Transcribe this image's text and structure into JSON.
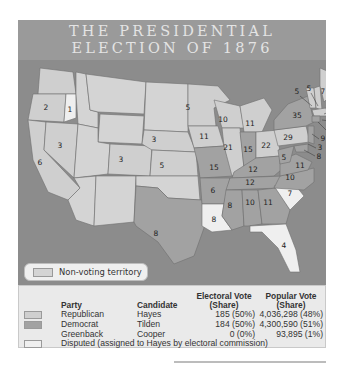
{
  "title": {
    "line1": "THE PRESIDENTIAL",
    "line2": "ELECTION OF 1876"
  },
  "map": {
    "colors": {
      "republican": "#cfcfcf",
      "democrat": "#a2a2a2",
      "disputed": "#efefef",
      "non_voting": "#d4d4d4",
      "water": "#8c8c8c"
    },
    "states": [
      {
        "name": "Oregon",
        "party": "Republican",
        "electoral_votes": "2"
      },
      {
        "name": "Oregon (disputed elector)",
        "party": "Disputed",
        "electoral_votes": "1"
      },
      {
        "name": "California",
        "party": "Republican",
        "electoral_votes": "6"
      },
      {
        "name": "Nevada",
        "party": "Republican",
        "electoral_votes": "3"
      },
      {
        "name": "Colorado",
        "party": "Republican",
        "electoral_votes": "3"
      },
      {
        "name": "Nebraska",
        "party": "Republican",
        "electoral_votes": "3"
      },
      {
        "name": "Kansas",
        "party": "Republican",
        "electoral_votes": "5"
      },
      {
        "name": "Texas",
        "party": "Democrat",
        "electoral_votes": "8"
      },
      {
        "name": "Minnesota",
        "party": "Republican",
        "electoral_votes": "5"
      },
      {
        "name": "Iowa",
        "party": "Republican",
        "electoral_votes": "11"
      },
      {
        "name": "Missouri",
        "party": "Democrat",
        "electoral_votes": "15"
      },
      {
        "name": "Arkansas",
        "party": "Democrat",
        "electoral_votes": "6"
      },
      {
        "name": "Louisiana",
        "party": "Disputed",
        "electoral_votes": "8"
      },
      {
        "name": "Wisconsin",
        "party": "Republican",
        "electoral_votes": "10"
      },
      {
        "name": "Illinois",
        "party": "Republican",
        "electoral_votes": "21"
      },
      {
        "name": "Michigan",
        "party": "Republican",
        "electoral_votes": "11"
      },
      {
        "name": "Indiana",
        "party": "Democrat",
        "electoral_votes": "15"
      },
      {
        "name": "Ohio",
        "party": "Republican",
        "electoral_votes": "22"
      },
      {
        "name": "Kentucky",
        "party": "Democrat",
        "electoral_votes": "12"
      },
      {
        "name": "Tennessee",
        "party": "Democrat",
        "electoral_votes": "12"
      },
      {
        "name": "Mississippi",
        "party": "Democrat",
        "electoral_votes": "8"
      },
      {
        "name": "Alabama",
        "party": "Democrat",
        "electoral_votes": "10"
      },
      {
        "name": "Georgia",
        "party": "Democrat",
        "electoral_votes": "11"
      },
      {
        "name": "Florida",
        "party": "Disputed",
        "electoral_votes": "4"
      },
      {
        "name": "South Carolina",
        "party": "Disputed",
        "electoral_votes": "7"
      },
      {
        "name": "North Carolina",
        "party": "Democrat",
        "electoral_votes": "10"
      },
      {
        "name": "Virginia",
        "party": "Democrat",
        "electoral_votes": "11"
      },
      {
        "name": "West Virginia",
        "party": "Democrat",
        "electoral_votes": "5"
      },
      {
        "name": "Pennsylvania",
        "party": "Republican",
        "electoral_votes": "29"
      },
      {
        "name": "New York",
        "party": "Democrat",
        "electoral_votes": "35"
      },
      {
        "name": "Vermont",
        "party": "Republican",
        "electoral_votes": "5"
      },
      {
        "name": "New Hampshire",
        "party": "Republican",
        "electoral_votes": "5"
      },
      {
        "name": "Maine",
        "party": "Republican",
        "electoral_votes": "7"
      },
      {
        "name": "Massachusetts",
        "party": "Republican",
        "electoral_votes": "13"
      },
      {
        "name": "Rhode Island",
        "party": "Republican",
        "electoral_votes": "4"
      },
      {
        "name": "Connecticut",
        "party": "Democrat",
        "electoral_votes": "6"
      },
      {
        "name": "New Jersey",
        "party": "Democrat",
        "electoral_votes": "9"
      },
      {
        "name": "Delaware",
        "party": "Democrat",
        "electoral_votes": "3"
      },
      {
        "name": "Maryland",
        "party": "Democrat",
        "electoral_votes": "8"
      }
    ],
    "non_voting_label": "Non-voting territory"
  },
  "legend": {
    "headers": {
      "party": "Party",
      "candidate": "Candidate",
      "electoral_vote_1": "Electoral Vote",
      "electoral_vote_2": "(Share)",
      "popular_vote_1": "Popular Vote",
      "popular_vote_2": "(Share)"
    },
    "rows": [
      {
        "party": "Republican",
        "candidate": "Hayes",
        "electoral": "185 (50%)",
        "popular": "4,036,298 (48%)",
        "swatch": "#cfcfcf"
      },
      {
        "party": "Democrat",
        "candidate": "Tilden",
        "electoral": "184 (50%)",
        "popular": "4,300,590 (51%)",
        "swatch": "#a2a2a2"
      },
      {
        "party": "Greenback",
        "candidate": "Cooper",
        "electoral": "0 (0%)",
        "popular": "93,895 (1%)",
        "swatch": ""
      }
    ],
    "disputed_note": "Disputed (assigned to Hayes by electoral commission)",
    "disputed_swatch": "#efefef"
  }
}
